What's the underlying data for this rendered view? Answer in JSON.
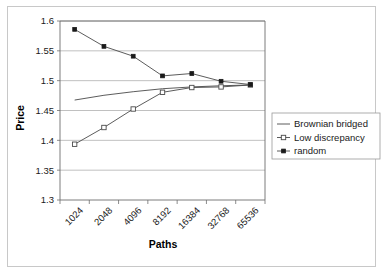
{
  "chart_data": {
    "type": "line",
    "title": "",
    "xlabel": "Paths",
    "ylabel": "Price",
    "categories": [
      "1024",
      "2048",
      "4096",
      "8192",
      "16384",
      "32768",
      "65536"
    ],
    "ylim": [
      1.3,
      1.6
    ],
    "yticks": [
      "1.3",
      "1.35",
      "1.4",
      "1.45",
      "1.5",
      "1.55",
      "1.6"
    ],
    "ytick_values": [
      1.3,
      1.35,
      1.4,
      1.45,
      1.5,
      1.55,
      1.6
    ],
    "grid": "horizontal",
    "legend_position": "right",
    "series": [
      {
        "name": "Brownian bridged",
        "marker": "none",
        "values": [
          1.4675,
          1.4755,
          1.4815,
          1.4865,
          1.4895,
          1.4915,
          1.4928
        ]
      },
      {
        "name": "Low discrepancy",
        "marker": "open-square",
        "values": [
          1.3935,
          1.4215,
          1.4525,
          1.4805,
          1.4885,
          1.4895,
          1.4928
        ]
      },
      {
        "name": "random",
        "marker": "filled-square",
        "values": [
          1.586,
          1.5575,
          1.541,
          1.508,
          1.512,
          1.499,
          1.4935
        ]
      }
    ]
  },
  "legend": {
    "items": [
      {
        "label": "Brownian bridged",
        "marker": "none"
      },
      {
        "label": "Low discrepancy",
        "marker": "open-square"
      },
      {
        "label": "random",
        "marker": "filled-square"
      }
    ]
  }
}
